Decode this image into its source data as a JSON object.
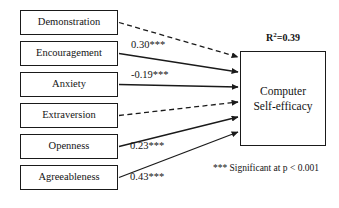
{
  "diagram": {
    "type": "path-model",
    "outcome": {
      "label_line1": "Computer",
      "label_line2": "Self-efficacy",
      "r2_prefix": "R",
      "r2_exponent": "2",
      "r2_value": "=0.39"
    },
    "predictors": [
      {
        "label": "Demonstration",
        "coefficient": "",
        "line_style": "dashed",
        "significant": false
      },
      {
        "label": "Encouragement",
        "coefficient": "0.30***",
        "line_style": "solid",
        "significant": true
      },
      {
        "label": "Anxiety",
        "coefficient": "-0.19***",
        "line_style": "solid",
        "significant": true
      },
      {
        "label": "Extraversion",
        "coefficient": "",
        "line_style": "dashed",
        "significant": false
      },
      {
        "label": "Openness",
        "coefficient": "0.23***",
        "line_style": "solid",
        "significant": true
      },
      {
        "label": "Agreeableness",
        "coefficient": "0.43***",
        "line_style": "solid",
        "significant": true
      }
    ],
    "footnote": "*** Significant at p < 0.001",
    "colors": {
      "stroke": "#1a1a1a",
      "text": "#141414",
      "background": "#ffffff"
    }
  }
}
